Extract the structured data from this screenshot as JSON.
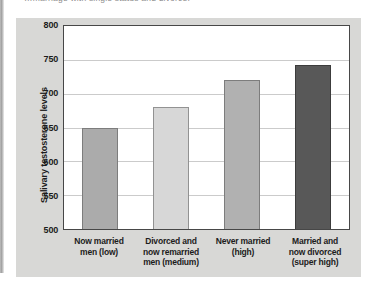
{
  "page": {
    "caption_fragment": "…marriage with single status and divorce."
  },
  "chart_data": {
    "type": "bar",
    "title": "",
    "xlabel": "",
    "ylabel": "Salivary testosterone levels",
    "ylim": [
      500,
      800
    ],
    "yticks": [
      500,
      550,
      600,
      650,
      700,
      750,
      800
    ],
    "grid": true,
    "legend": false,
    "categories": [
      "Now married men (low)",
      "Divorced and now remarried men (medium)",
      "Never married (high)",
      "Married and now divorced (super high)"
    ],
    "category_lines": [
      [
        "Now married",
        "men (low)"
      ],
      [
        "Divorced and",
        "now remarried",
        "men (medium)"
      ],
      [
        "Never married",
        "(high)"
      ],
      [
        "Married and",
        "now divorced",
        "(super high)"
      ]
    ],
    "values": [
      650,
      680,
      720,
      742
    ],
    "bar_colors": [
      "#ababab",
      "#d7d7d7",
      "#b1b1b1",
      "#585858"
    ],
    "bar_border_colors": [
      "#7d7d7d",
      "#929292",
      "#7d7d7d",
      "#3c3c3c"
    ],
    "colors": {
      "panel_bg": "#d8d8d6",
      "plot_bg": "#ffffff",
      "gridline": "#cbcbcb",
      "frame": "#474747",
      "text": "#1c1c1c"
    }
  }
}
